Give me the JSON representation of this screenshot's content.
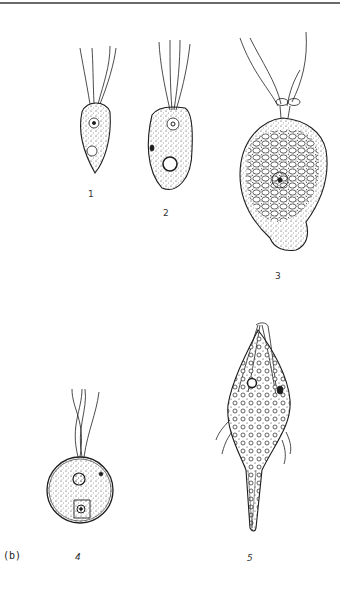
{
  "figure": {
    "panel_label": "(b)",
    "organisms": [
      {
        "id": 1,
        "label": "1",
        "shape": "pear/obovate, 4 anterior flagella",
        "label_pos": [
          88,
          190
        ]
      },
      {
        "id": 2,
        "label": "2",
        "shape": "oblong, 4 anterior flagella, large vacuole",
        "label_pos": [
          163,
          209
        ]
      },
      {
        "id": 3,
        "label": "3",
        "shape": "large pyriform with many vesicles, flagella through collar loop",
        "label_pos": [
          275,
          272
        ]
      },
      {
        "id": 4,
        "label": "4",
        "shape": "spherical, 4 twisted flagella",
        "label_pos": [
          75,
          553
        ]
      },
      {
        "id": 5,
        "label": "5",
        "shape": "spindle with long caudal tail, recurrent flagella",
        "label_pos": [
          247,
          554
        ]
      }
    ]
  },
  "colors": {
    "ink": "#1e1e1e",
    "rule": "#6a6a6a",
    "background": "#ffffff"
  }
}
